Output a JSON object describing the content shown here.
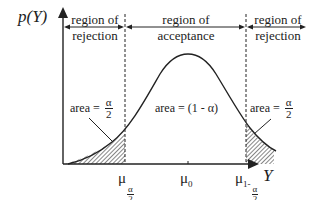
{
  "diagram": {
    "y_axis_label": "p(Y)",
    "x_axis_label": "Y",
    "regions": {
      "left": {
        "line1": "region of",
        "line2": "rejection"
      },
      "center": {
        "line1": "region of",
        "line2": "acceptance"
      },
      "right": {
        "line1": "region of",
        "line2": "rejection"
      }
    },
    "areas": {
      "left": {
        "prefix": "area =",
        "numerator": "α",
        "denominator": "2"
      },
      "center": {
        "text": "area = (1 - α)"
      },
      "right": {
        "prefix": "area =",
        "numerator": "α",
        "denominator": "2"
      }
    },
    "x_ticks": {
      "left": {
        "symbol": "μ",
        "sub_numerator": "α",
        "sub_denominator": "2"
      },
      "center": {
        "symbol": "μ",
        "subscript": "0"
      },
      "right": {
        "symbol": "μ",
        "sub_prefix": "1-",
        "sub_numerator": "α",
        "sub_denominator": "2"
      }
    },
    "colors": {
      "ink": "#222222",
      "background": "#ffffff"
    }
  }
}
